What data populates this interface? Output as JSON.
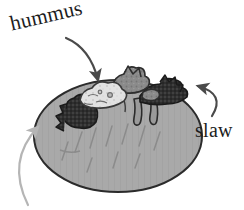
{
  "figure": {
    "background_color": "#ffffff",
    "width": 244,
    "height": 210
  },
  "labels": {
    "hummus": "hummus",
    "slaw": "slaw"
  },
  "annotations": [
    {
      "id": "hummus",
      "label": "hummus",
      "arrow": "curved-arrow-down",
      "points_to": "light topping spread on top of potato",
      "color": "#4a4a4a"
    },
    {
      "id": "slaw",
      "label": "slaw",
      "arrow": "curved-arrow-left",
      "points_to": "dark shredded topping on right side",
      "color": "#4a4a4a"
    },
    {
      "id": "cropped-bottom-left",
      "label": "",
      "arrow": "curved-arrow-up",
      "points_to": "left side of potato",
      "color": "#b5b5b5"
    }
  ],
  "illustration": {
    "subject": "baked potato",
    "parts": [
      {
        "name": "potato-body",
        "color": "#a9a9a9",
        "outline": "#2b2b2b"
      },
      {
        "name": "hummus-topping",
        "color": "#e2e2e2",
        "outline": "#3a3a3a"
      },
      {
        "name": "chunky-topping",
        "color": "#8b8b8b",
        "outline": "#2e2e2e"
      },
      {
        "name": "slaw-topping",
        "color": "#2f2f2f",
        "outline": "#1a1a1a"
      },
      {
        "name": "drips",
        "color": "#9a9a9a",
        "outline": "#2b2b2b"
      },
      {
        "name": "skin-texture-strokes",
        "color": "#8d8d8d"
      }
    ]
  },
  "colors": {
    "ink": "#1d1d1d",
    "arrow_dark": "#4a4a4a",
    "arrow_light": "#b5b5b5",
    "potato": "#a9a9a9",
    "hummus": "#e2e2e2",
    "slaw": "#2f2f2f",
    "chunk": "#8b8b8b"
  }
}
